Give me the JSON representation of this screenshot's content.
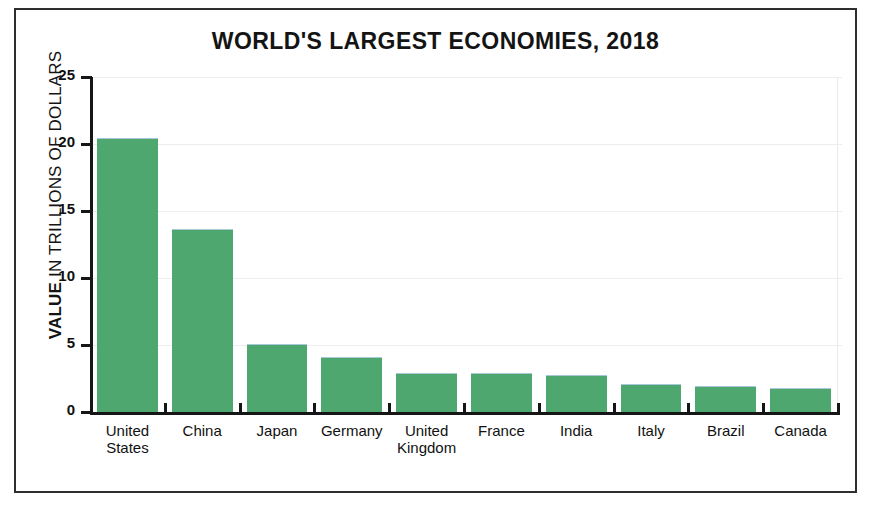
{
  "figure": {
    "title": "WORLD'S LARGEST ECONOMIES, 2018",
    "frame_color": "#2e2e2e",
    "background": "#ffffff",
    "edge_credit": ""
  },
  "axes": {
    "y_title_strong": "VALUE",
    "y_title_rest": " IN TRILLIONS OF DOLLARS",
    "y_ticks": [
      "0",
      "5",
      "10",
      "15",
      "20",
      "25"
    ],
    "axis_color": "#161616",
    "grid_color": "#ececf1"
  },
  "chart_data": {
    "type": "bar",
    "title": "WORLD'S LARGEST ECONOMIES, 2018",
    "xlabel": "",
    "ylabel": "VALUE IN TRILLIONS OF DOLLARS",
    "ylim": [
      0,
      25
    ],
    "yticks": [
      0,
      5,
      10,
      15,
      20,
      25
    ],
    "grid": true,
    "legend": "none",
    "bar_color": "#4ea76f",
    "categories": [
      "United\nStates",
      "China",
      "Japan",
      "Germany",
      "United\nKingdom",
      "France",
      "India",
      "Italy",
      "Brazil",
      "Canada"
    ],
    "values": [
      20.4,
      13.6,
      5.0,
      4.0,
      2.8,
      2.8,
      2.7,
      2.0,
      1.9,
      1.7
    ]
  }
}
